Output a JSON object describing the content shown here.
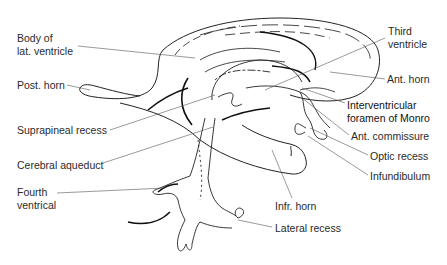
{
  "diagram": {
    "background": "#ffffff",
    "line_color": "#222222",
    "labels": [
      {
        "id": "body-lat-ventricle",
        "text": "Body of\nlat. ventricle",
        "x": 17,
        "y": 32
      },
      {
        "id": "post-horn",
        "text": "Post. horn",
        "x": 17,
        "y": 79
      },
      {
        "id": "suprapineal-recess",
        "text": "Suprapineal recess",
        "x": 17,
        "y": 124
      },
      {
        "id": "cerebral-aqueduct",
        "text": "Cerebral aqueduct",
        "x": 17,
        "y": 159
      },
      {
        "id": "fourth-ventrical",
        "text": "Fourth\nventrical",
        "x": 17,
        "y": 186
      },
      {
        "id": "third-ventricle",
        "text": "Third\nventricle",
        "x": 388,
        "y": 25
      },
      {
        "id": "ant-horn",
        "text": "Ant. horn",
        "x": 387,
        "y": 73
      },
      {
        "id": "interventricular-foramen",
        "text": "Interventricular\nforamen of Monro",
        "x": 347,
        "y": 99
      },
      {
        "id": "ant-commissure",
        "text": "Ant. commissure",
        "x": 351,
        "y": 130
      },
      {
        "id": "optic-recess",
        "text": "Optic recess",
        "x": 370,
        "y": 150
      },
      {
        "id": "infundibulum",
        "text": "Infundibulum",
        "x": 370,
        "y": 170
      },
      {
        "id": "infr-horn",
        "text": "Infr. horn",
        "x": 275,
        "y": 200
      },
      {
        "id": "lateral-recess",
        "text": "Lateral recess",
        "x": 275,
        "y": 222
      }
    ]
  }
}
